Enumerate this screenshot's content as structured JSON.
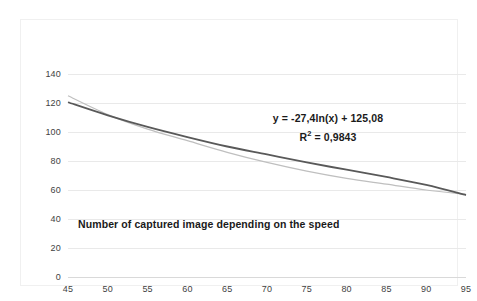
{
  "chart_data": {
    "type": "line",
    "title": "Number of captured image depending on the speed",
    "xlabel": "",
    "ylabel": "",
    "xlim": [
      45,
      95
    ],
    "ylim": [
      0,
      140
    ],
    "grid": "horizontal",
    "legend": "none",
    "x_ticks": [
      45,
      50,
      55,
      60,
      65,
      70,
      75,
      80,
      85,
      90,
      95
    ],
    "y_ticks": [
      0,
      20,
      40,
      60,
      80,
      100,
      120,
      140
    ],
    "categories": [
      45,
      50,
      55,
      60,
      65,
      70,
      75,
      80,
      85,
      90,
      95
    ],
    "series": [
      {
        "name": "Number of captured images",
        "color": "#bfbfbf",
        "values": [
          125,
          112,
          102,
          94,
          86,
          79,
          73,
          68,
          64,
          60,
          57
        ]
      },
      {
        "name": "Logarithmic trendline",
        "color": "#595959",
        "values": [
          120.5,
          111.5,
          103.5,
          96.5,
          90,
          84.5,
          79,
          74,
          69,
          63.5,
          56.5
        ]
      }
    ],
    "annotations": {
      "equation": "y = -27,4ln(x) + 125,08",
      "r_squared_prefix": "R",
      "r_squared_exp": "2",
      "r_squared_value": " = 0,9843"
    },
    "colors": {
      "gridline": "#e9e9e9",
      "baseline": "#d9d9d9",
      "tick_text": "#3f3f3f",
      "annotation_text": "#1a1a1a",
      "background": "#ffffff",
      "frame": "#f0f0f0"
    }
  }
}
